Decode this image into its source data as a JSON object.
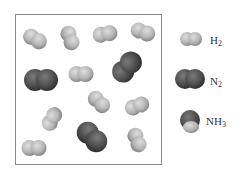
{
  "diagram": {
    "container": {
      "label": "reaction-container"
    },
    "colors": {
      "h2_light": "#c9c9c9",
      "h2_dark": "#8f8f8f",
      "n2_light": "#6a6a6a",
      "n2_dark": "#3a3a3a"
    },
    "molecules": [
      {
        "type": "H2",
        "cx": 35,
        "cy": 39,
        "angle": 30
      },
      {
        "type": "H2",
        "cx": 70,
        "cy": 38,
        "angle": 70
      },
      {
        "type": "H2",
        "cx": 105,
        "cy": 34,
        "angle": -10
      },
      {
        "type": "H2",
        "cx": 143,
        "cy": 32,
        "angle": 20
      },
      {
        "type": "N2",
        "cx": 41,
        "cy": 80,
        "angle": 0
      },
      {
        "type": "H2",
        "cx": 81,
        "cy": 74,
        "angle": 0
      },
      {
        "type": "N2",
        "cx": 127,
        "cy": 67,
        "angle": -50
      },
      {
        "type": "H2",
        "cx": 99,
        "cy": 102,
        "angle": 45
      },
      {
        "type": "H2",
        "cx": 137,
        "cy": 106,
        "angle": -20
      },
      {
        "type": "H2",
        "cx": 52,
        "cy": 119,
        "angle": -60
      },
      {
        "type": "N2",
        "cx": 92,
        "cy": 137,
        "angle": 45
      },
      {
        "type": "H2",
        "cx": 34,
        "cy": 148,
        "angle": 0
      },
      {
        "type": "H2",
        "cx": 137,
        "cy": 140,
        "angle": 70
      }
    ]
  },
  "legend": [
    {
      "formula": "H",
      "subscript": "2",
      "type": "H2"
    },
    {
      "formula": "N",
      "subscript": "2",
      "type": "N2"
    },
    {
      "formula": "NH",
      "subscript": "3",
      "type": "NH3"
    }
  ]
}
